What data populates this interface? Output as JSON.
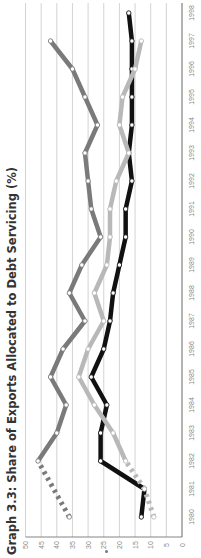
{
  "chart_data": {
    "type": "line",
    "orientation": "rotated-90-ccw",
    "title": "Graph 3.3:  Share of Exports Allocated to Debt Servicing (%)",
    "xlabel": "",
    "ylabel": "",
    "x": [
      1980,
      1981,
      1982,
      1983,
      1984,
      1985,
      1986,
      1987,
      1988,
      1989,
      1990,
      1991,
      1992,
      1993,
      1994,
      1995,
      1996,
      1997,
      1998
    ],
    "x_tick_labels": [
      "1980",
      "1981",
      "1982",
      "1983",
      "1984",
      "1985",
      "1986",
      "1987",
      "1988",
      "1989",
      "1990",
      "1991",
      "1992",
      "1993",
      "1994",
      "1995",
      "1996",
      "1997",
      "1998"
    ],
    "ylim": [
      0,
      50
    ],
    "y_ticks": [
      0,
      5,
      10,
      15,
      20,
      25,
      30,
      35,
      40,
      45,
      50
    ],
    "y_tick_labels": [
      "0",
      "5",
      "10",
      "15",
      "20",
      "25",
      "30",
      "35",
      "40",
      "45",
      "50"
    ],
    "grid": true,
    "legend": null,
    "series": [
      {
        "name": "series-dark-gray",
        "color": "#7a7a7a",
        "values": [
          36,
          null,
          46,
          40,
          37,
          42,
          38,
          31,
          36,
          32,
          26,
          29,
          30,
          31,
          27,
          31,
          35,
          42,
          null
        ],
        "dashed_segment": [
          1980,
          1982
        ]
      },
      {
        "name": "series-black",
        "color": "#111111",
        "values": [
          13,
          12,
          26,
          26,
          24,
          29,
          25,
          23,
          22,
          20,
          18,
          18,
          16,
          17,
          16,
          16,
          16,
          16,
          17
        ]
      },
      {
        "name": "series-light-gray",
        "color": "#b8b8b8",
        "values": [
          9,
          12,
          18,
          22,
          28,
          33,
          30,
          25,
          28,
          24,
          23,
          23,
          21,
          17,
          20,
          19,
          15,
          13,
          null
        ],
        "dashed_segment": [
          1980,
          1982
        ]
      }
    ]
  },
  "colors": {
    "gridline": "#c8c8c8",
    "axis": "#666666",
    "tick_text": "#8a8a8a",
    "title": "#333333"
  }
}
